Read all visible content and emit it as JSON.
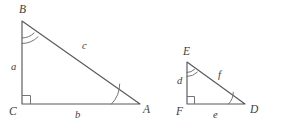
{
  "figure": {
    "background_color": "#ffffff",
    "line_color": "#58595b",
    "mark_color": "#6d6e71",
    "label_color": "#404041",
    "width": 293,
    "height": 131
  },
  "triangles": [
    {
      "name": "triangle-abc",
      "vertices": [
        {
          "label": "B",
          "x": 22,
          "y": 21,
          "label_x": 19,
          "label_y": 4,
          "angle_mark": "double-arc"
        },
        {
          "label": "C",
          "x": 22,
          "y": 104,
          "label_x": 9,
          "label_y": 106,
          "angle_mark": "right-angle-square"
        },
        {
          "label": "A",
          "x": 140,
          "y": 104,
          "label_x": 143,
          "label_y": 104,
          "angle_mark": "single-arc"
        }
      ],
      "sides": [
        {
          "label": "a",
          "from": "B",
          "to": "C",
          "label_x": 11,
          "label_y": 62
        },
        {
          "label": "b",
          "from": "C",
          "to": "A",
          "label_x": 75,
          "label_y": 110
        },
        {
          "label": "c",
          "from": "B",
          "to": "A",
          "label_x": 82,
          "label_y": 41
        }
      ]
    },
    {
      "name": "triangle-def",
      "vertices": [
        {
          "label": "E",
          "x": 187,
          "y": 62,
          "label_x": 183,
          "label_y": 46,
          "angle_mark": "double-arc"
        },
        {
          "label": "F",
          "x": 187,
          "y": 104,
          "label_x": 176,
          "label_y": 106,
          "angle_mark": "right-angle-square"
        },
        {
          "label": "D",
          "x": 245,
          "y": 104,
          "label_x": 250,
          "label_y": 104,
          "angle_mark": "single-arc"
        }
      ],
      "sides": [
        {
          "label": "d",
          "from": "E",
          "to": "F",
          "label_x": 177,
          "label_y": 76
        },
        {
          "label": "e",
          "from": "F",
          "to": "D",
          "label_x": 213,
          "label_y": 110
        },
        {
          "label": "f",
          "from": "E",
          "to": "D",
          "label_x": 218,
          "label_y": 70
        }
      ]
    }
  ]
}
